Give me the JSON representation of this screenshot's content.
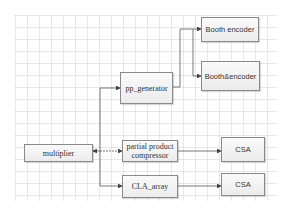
{
  "diagram": {
    "nodes": [
      {
        "id": "booth_encoder",
        "label": "Booth encoder",
        "x": 201,
        "y": 17,
        "w": 58,
        "h": 25
      },
      {
        "id": "booth_and_encoder",
        "label": "Booth&encoder",
        "x": 201,
        "y": 61,
        "w": 59,
        "h": 30
      },
      {
        "id": "pp_generator",
        "label": "pp_generator",
        "x": 120,
        "y": 72,
        "w": 53,
        "h": 32
      },
      {
        "id": "multiplier",
        "label": "multiplier",
        "x": 24,
        "y": 144,
        "w": 69,
        "h": 18
      },
      {
        "id": "partial_product_compressor",
        "label": "partial product compressor",
        "x": 122,
        "y": 140,
        "w": 56,
        "h": 22
      },
      {
        "id": "csa_1",
        "label": "CSA",
        "x": 221,
        "y": 137,
        "w": 44,
        "h": 25
      },
      {
        "id": "cla_array",
        "label": "CLA_array",
        "x": 122,
        "y": 175,
        "w": 56,
        "h": 23
      },
      {
        "id": "csa_2",
        "label": "CSA",
        "x": 221,
        "y": 173,
        "w": 44,
        "h": 23
      }
    ],
    "edges": [
      {
        "from": "multiplier",
        "to": "pp_generator"
      },
      {
        "from": "multiplier",
        "to": "partial_product_compressor"
      },
      {
        "from": "multiplier",
        "to": "cla_array"
      },
      {
        "from": "pp_generator",
        "to": "booth_encoder"
      },
      {
        "from": "pp_generator",
        "to": "booth_and_encoder"
      },
      {
        "from": "partial_product_compressor",
        "to": "csa_1"
      },
      {
        "from": "cla_array",
        "to": "csa_2"
      }
    ],
    "colors": {
      "line": "#555555",
      "box_border": "#8a8a8a",
      "box_fill": "#f0f0f0",
      "grid": "#d0d0d0"
    }
  }
}
